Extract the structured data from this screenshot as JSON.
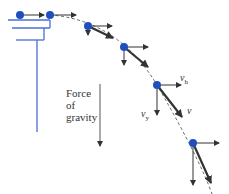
{
  "diagram": {
    "colors": {
      "ball": "#1f4fbf",
      "table": "#4a6fd6",
      "vector": "#333333",
      "path": "#444444",
      "text": "#333333"
    },
    "gravity_label": {
      "line1": "Force",
      "line2": "of",
      "line3": "gravity"
    },
    "vector_labels": {
      "horizontal": "v",
      "horizontal_sub": "h",
      "vertical": "v",
      "vertical_sub": "y",
      "resultant": "v"
    },
    "balls": [
      {
        "x": 20,
        "y": 15,
        "vh_end": 44,
        "vy_end": null,
        "v_end": null
      },
      {
        "x": 50,
        "y": 15,
        "vh_end": 76,
        "vy_end": null,
        "v_end": null
      },
      {
        "x": 88,
        "y": 26,
        "vh_end": 112,
        "vy_end": 35,
        "v_end": [
          113,
          38
        ]
      },
      {
        "x": 124,
        "y": 47,
        "vh_end": 148,
        "vy_end": 65,
        "v_end": [
          148,
          67
        ]
      },
      {
        "x": 157,
        "y": 85,
        "vh_end": 181,
        "vy_end": 115,
        "v_end": [
          182,
          117
        ]
      },
      {
        "x": 193,
        "y": 143,
        "vh_end": 219,
        "vy_end": 185,
        "v_end": [
          211,
          183
        ]
      }
    ]
  }
}
